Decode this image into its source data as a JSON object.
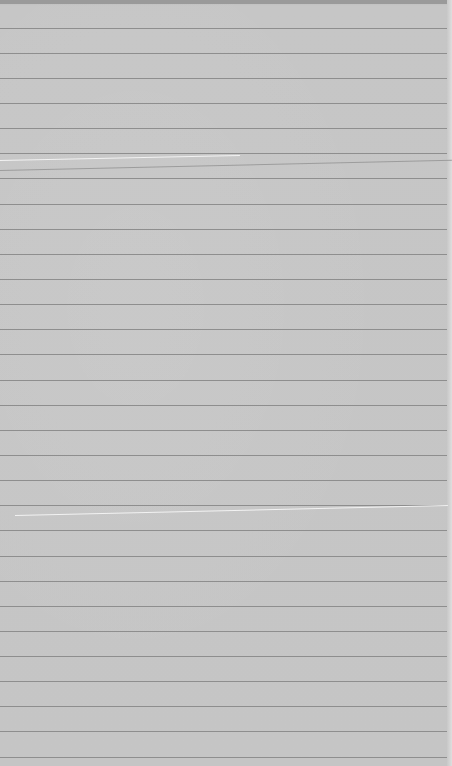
{
  "image": {
    "description": "Photo of a sheet of gray lined notebook paper",
    "background_color": "#c5c5c5",
    "rule_color": "#8e8e8e",
    "rule_positions_y": [
      28,
      53,
      78,
      103,
      128,
      153,
      178,
      204,
      229,
      254,
      279,
      304,
      329,
      354,
      380,
      405,
      430,
      455,
      480,
      505,
      530,
      556,
      581,
      606,
      631,
      656,
      681,
      706,
      731,
      757
    ],
    "creases": [
      {
        "x1": 0,
        "y1": 160,
        "x2": 240,
        "y2": 155
      },
      {
        "x1": 15,
        "y1": 515,
        "x2": 448,
        "y2": 505
      }
    ]
  }
}
